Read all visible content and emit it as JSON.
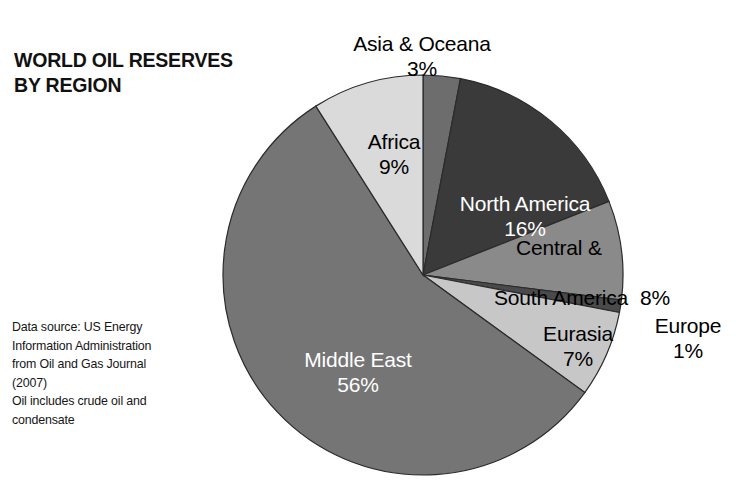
{
  "chart_data": {
    "type": "pie",
    "title": "WORLD OIL RESERVES\nBY REGION",
    "subtitle": "",
    "xlabel": "",
    "ylabel": "",
    "legend_position": "none",
    "grid": false,
    "units": "percent",
    "total": 100,
    "start_angle_deg": 0,
    "direction": "clockwise",
    "categories": [
      "Asia & Oceana",
      "North America",
      "Central & South America",
      "Europe",
      "Eurasia",
      "Middle East",
      "Africa"
    ],
    "values": [
      3,
      16,
      8,
      1,
      7,
      56,
      9
    ],
    "value_labels": [
      "3%",
      "16%",
      "8%",
      "1%",
      "7%",
      "56%",
      "9%"
    ],
    "colors": [
      "#6d6d6d",
      "#3a3a3a",
      "#8a8a8a",
      "#4a4a4a",
      "#c7c7c7",
      "#757575",
      "#dadada"
    ],
    "slices": [
      {
        "name": "Asia & Oceana",
        "value": 3,
        "value_label": "3%",
        "label": "Asia & Oceana",
        "color": "#6d6d6d",
        "label_color": "#000000",
        "label_placement": "outside-top"
      },
      {
        "name": "North America",
        "value": 16,
        "value_label": "16%",
        "label": "North America",
        "color": "#3a3a3a",
        "label_color": "#ffffff",
        "label_placement": "inside"
      },
      {
        "name": "Central & South America",
        "value": 8,
        "value_label": "8%",
        "label": "Central &\nSouth America",
        "color": "#8a8a8a",
        "label_color": "#000000",
        "label_placement": "outside-right"
      },
      {
        "name": "Europe",
        "value": 1,
        "value_label": "1%",
        "label": "Europe",
        "color": "#4a4a4a",
        "label_color": "#000000",
        "label_placement": "outside-right"
      },
      {
        "name": "Eurasia",
        "value": 7,
        "value_label": "7%",
        "label": "Eurasia",
        "color": "#c7c7c7",
        "label_color": "#000000",
        "label_placement": "inside"
      },
      {
        "name": "Middle East",
        "value": 56,
        "value_label": "56%",
        "label": "Middle East",
        "color": "#757575",
        "label_color": "#ffffff",
        "label_placement": "inside"
      },
      {
        "name": "Africa",
        "value": 9,
        "value_label": "9%",
        "label": "Africa",
        "color": "#dadada",
        "label_color": "#000000",
        "label_placement": "inside"
      }
    ],
    "source_note": "Data source: US Energy Information Administration from Oil and Gas Journal (2007)\nOil includes crude oil and condensate"
  },
  "title": {
    "text": "WORLD OIL RESERVES\nBY REGION"
  },
  "source": {
    "text": "Data source: US Energy\nInformation Administration\nfrom Oil and Gas Journal\n(2007)\nOil includes crude oil and\ncondensate"
  },
  "labels": {
    "asia": {
      "name": "Asia & Oceana",
      "pct": "3%"
    },
    "africa": {
      "name": "Africa",
      "pct": "9%"
    },
    "north_america": {
      "name": "North America",
      "pct": "16%"
    },
    "central_south_america": {
      "line1": "Central &",
      "line2": "South America",
      "pct": "8%"
    },
    "eurasia": {
      "name": "Eurasia",
      "pct": "7%"
    },
    "europe": {
      "name": "Europe",
      "pct": "1%"
    },
    "middle_east": {
      "name": "Middle East",
      "pct": "56%"
    }
  },
  "colors": {
    "background": "#ffffff",
    "text": "#111111",
    "asia": "#6d6d6d",
    "north_america": "#3a3a3a",
    "central_south_america": "#8a8a8a",
    "europe": "#4a4a4a",
    "eurasia": "#c7c7c7",
    "middle_east": "#757575",
    "africa": "#dadada",
    "slice_outline": "#2b2b2b"
  }
}
